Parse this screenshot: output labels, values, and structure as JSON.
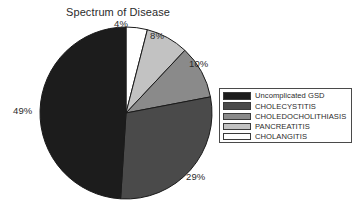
{
  "chart_data": {
    "type": "pie",
    "title": "Spectrum of Disease",
    "xlabel": "",
    "ylabel": "",
    "legend_position": "right",
    "grid": false,
    "start_angle_deg": 0,
    "direction": "clockwise",
    "categories": [
      "Uncomplicated GSD",
      "CHOLECYSTITIS",
      "CHOLEDOCHOLITHIASIS",
      "PANCREATITIS",
      "CHOLANGITIS"
    ],
    "values": [
      49,
      29,
      10,
      8,
      4
    ],
    "data_labels": [
      "49%",
      "29%",
      "10%",
      "8%",
      "4%"
    ],
    "colors": [
      "#1c1c1c",
      "#4a4a4a",
      "#8a8a8a",
      "#c2c2c2",
      "#ffffff"
    ],
    "slices": [
      {
        "label": "CHOLANGITIS",
        "value": 4,
        "data_label": "4%",
        "color": "#ffffff"
      },
      {
        "label": "PANCREATITIS",
        "value": 8,
        "data_label": "8%",
        "color": "#c2c2c2"
      },
      {
        "label": "CHOLEDOCHOLITHIASIS",
        "value": 10,
        "data_label": "10%",
        "color": "#8a8a8a"
      },
      {
        "label": "CHOLECYSTITIS",
        "value": 29,
        "data_label": "29%",
        "color": "#4a4a4a"
      },
      {
        "label": "Uncomplicated GSD",
        "value": 49,
        "data_label": "49%",
        "color": "#1c1c1c"
      }
    ]
  },
  "title": {
    "text": "Spectrum of Disease"
  },
  "pct_labels": {
    "cholangitis": "4%",
    "pancreatitis": "8%",
    "choledocholithiasis": "10%",
    "cholecystitis": "29%",
    "uncomplicated_gsd": "49%"
  },
  "legend": {
    "items": [
      {
        "label": "Uncomplicated GSD",
        "color": "#1c1c1c"
      },
      {
        "label": "CHOLECYSTITIS",
        "color": "#4a4a4a"
      },
      {
        "label": "CHOLEDOCHOLITHIASIS",
        "color": "#8a8a8a"
      },
      {
        "label": "PANCREATITIS",
        "color": "#c2c2c2"
      },
      {
        "label": "CHOLANGITIS",
        "color": "#ffffff"
      }
    ]
  }
}
